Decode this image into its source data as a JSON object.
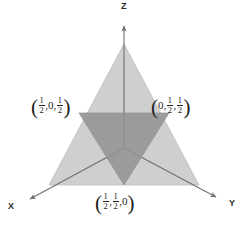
{
  "figure": {
    "background_color": "#ffffff",
    "width": 246,
    "height": 226
  },
  "axes": {
    "origin": {
      "x": 124,
      "y": 148
    },
    "items": [
      {
        "name": "z-axis",
        "label": "Z",
        "direction": "up",
        "tip": {
          "x": 124,
          "y": 20
        }
      },
      {
        "name": "x-axis",
        "label": "X",
        "direction": "down-left",
        "tip": {
          "x": 22,
          "y": 205
        }
      },
      {
        "name": "y-axis",
        "label": "Y",
        "direction": "down-right",
        "tip": {
          "x": 224,
          "y": 202
        }
      }
    ],
    "line_color": "#6f6f6f"
  },
  "outer_triangle": {
    "name": "outer-simplex-triangle",
    "fill": "#cfcfcf",
    "stroke": "#b4b4b4",
    "vertices": [
      {
        "x": 124,
        "y": 44
      },
      {
        "x": 199,
        "y": 185
      },
      {
        "x": 49,
        "y": 185
      }
    ]
  },
  "inner_triangle": {
    "name": "inner-medial-triangle",
    "fill": "#9b9b9b",
    "stroke": "#8a8a8a",
    "vertices": [
      {
        "x": 79,
        "y": 113
      },
      {
        "x": 169,
        "y": 113
      },
      {
        "x": 124,
        "y": 185
      }
    ]
  },
  "labels": {
    "left": {
      "name": "vertex-label-left",
      "text": "(1/2, 0, 1/2)",
      "parts": [
        "1/2",
        "0",
        "1/2"
      ]
    },
    "right": {
      "name": "vertex-label-right",
      "text": "(0, 1/2, 1/2)",
      "parts": [
        "0",
        "1/2",
        "1/2"
      ]
    },
    "bottom": {
      "name": "vertex-label-bottom",
      "text": "(1/2, 1/2, 0)",
      "parts": [
        "1/2",
        "1/2",
        "0"
      ]
    },
    "axis_z": "Z",
    "axis_x": "X",
    "axis_y": "Y",
    "numerator": "1",
    "denominator": "2",
    "zero": "0",
    "comma": ",",
    "paren_open": "(",
    "paren_close": ")"
  }
}
